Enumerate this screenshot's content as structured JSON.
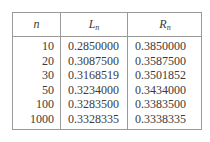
{
  "table": {
    "headers": {
      "n": {
        "base": "n",
        "sub": ""
      },
      "L": {
        "base": "L",
        "sub": "n"
      },
      "R": {
        "base": "R",
        "sub": "n"
      }
    },
    "rows": [
      {
        "n": "10",
        "L": "0.2850000",
        "R": "0.3850000"
      },
      {
        "n": "20",
        "L": "0.3087500",
        "R": "0.3587500"
      },
      {
        "n": "30",
        "L": "0.3168519",
        "R": "0.3501852"
      },
      {
        "n": "50",
        "L": "0.3234000",
        "R": "0.3434000"
      },
      {
        "n": "100",
        "L": "0.3283500",
        "R": "0.3383500"
      },
      {
        "n": "1000",
        "L": "0.3328335",
        "R": "0.3338335"
      }
    ]
  }
}
